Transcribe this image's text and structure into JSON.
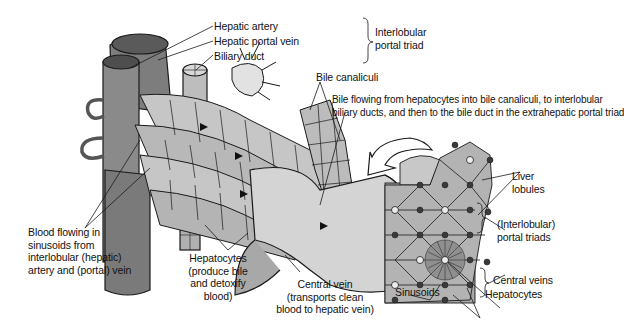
{
  "diagram": {
    "labels": {
      "hepatic_artery": "Hepatic artery",
      "hepatic_portal_vein": "Hepatic portal vein",
      "biliary_duct": "Biliary duct",
      "interlobular_portal_triad": [
        "Interlobular",
        "portal triad"
      ],
      "bile_canaliculi": "Bile canaliculi",
      "bile_flow": [
        "Bile flowing from hepatocytes into bile canaliculi, to interlobular",
        "biliary ducts, and then to the bile duct in the extrahepatic portal triad"
      ],
      "blood_flow": [
        "Blood flowing in",
        "sinusoids from",
        "interlobular (hepatic)",
        "artery and (portal) vein"
      ],
      "hepatocytes_main": [
        "Hepatocytes",
        "(produce bile",
        "and detoxify",
        "blood)"
      ],
      "central_vein": [
        "Central vein",
        "(transports clean",
        "blood to hepatic vein)"
      ],
      "liver_lobules": [
        "Liver",
        "lobules"
      ],
      "portal_triads": [
        "(Interlobular)",
        "portal triads"
      ],
      "central_veins": "Central veins",
      "sinusoids": "Sinusoids",
      "hepatocytes_inset": "Hepatocytes"
    },
    "colors": {
      "tissue_light": "#c9c9c9",
      "tissue_mid": "#a9a9a9",
      "tissue_dark": "#6e6e6e",
      "outline": "#1a1a1a",
      "lobule_fill": "#b3b3b3",
      "background": "#ffffff"
    }
  }
}
